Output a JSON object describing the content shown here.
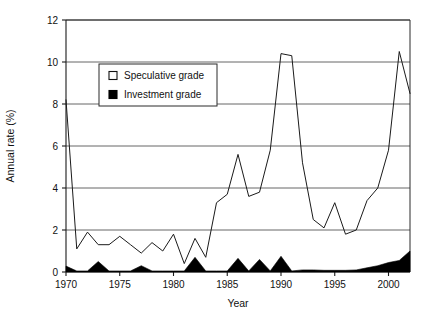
{
  "chart_data": {
    "type": "line",
    "title": "",
    "xlabel": "Year",
    "ylabel": "Annual rate (%)",
    "xlim": [
      1970,
      2002
    ],
    "ylim": [
      0,
      12
    ],
    "ytick_values": [
      0,
      2,
      4,
      6,
      8,
      10,
      12
    ],
    "ytick_labels": [
      "0",
      "2",
      "4",
      "6",
      "8",
      "10",
      "12"
    ],
    "xtick_values": [
      1970,
      1975,
      1980,
      1985,
      1990,
      1995,
      2000
    ],
    "xtick_labels": [
      "1970",
      "1975",
      "1980",
      "1985",
      "1990",
      "1995",
      "2000"
    ],
    "grid": "horizontal",
    "legend_position": "upper-left-inside",
    "x": [
      1970,
      1971,
      1972,
      1973,
      1974,
      1975,
      1976,
      1977,
      1978,
      1979,
      1980,
      1981,
      1982,
      1983,
      1984,
      1985,
      1986,
      1987,
      1988,
      1989,
      1990,
      1991,
      1992,
      1993,
      1994,
      1995,
      1996,
      1997,
      1998,
      1999,
      2000,
      2001,
      2002
    ],
    "series": [
      {
        "name": "Speculative grade",
        "style": "line",
        "color": "#1a1a1a",
        "values": [
          8.2,
          1.1,
          1.9,
          1.3,
          1.3,
          1.7,
          1.3,
          0.9,
          1.4,
          1.0,
          1.8,
          0.4,
          1.6,
          0.7,
          3.3,
          3.7,
          5.6,
          3.6,
          3.8,
          5.8,
          10.4,
          10.3,
          5.2,
          2.5,
          2.1,
          3.3,
          1.8,
          2.0,
          3.4,
          4.0,
          5.8,
          10.5,
          8.5
        ]
      },
      {
        "name": "Investment grade",
        "style": "filled-area",
        "color": "#000000",
        "values": [
          0.28,
          0.05,
          0.05,
          0.5,
          0.05,
          0.05,
          0.05,
          0.3,
          0.05,
          0.05,
          0.05,
          0.05,
          0.7,
          0.05,
          0.05,
          0.05,
          0.65,
          0.05,
          0.6,
          0.05,
          0.75,
          0.05,
          0.1,
          0.1,
          0.08,
          0.08,
          0.08,
          0.1,
          0.2,
          0.3,
          0.45,
          0.55,
          1.0
        ]
      }
    ],
    "legend": [
      {
        "label": "Speculative grade",
        "marker": "open-square"
      },
      {
        "label": "Investment grade",
        "marker": "filled-square"
      }
    ]
  },
  "layout": {
    "plot_left": 66,
    "plot_right": 410,
    "plot_top": 20,
    "plot_bottom": 272,
    "legend_x": 99,
    "legend_y": 64,
    "legend_w": 118,
    "legend_h": 42
  }
}
